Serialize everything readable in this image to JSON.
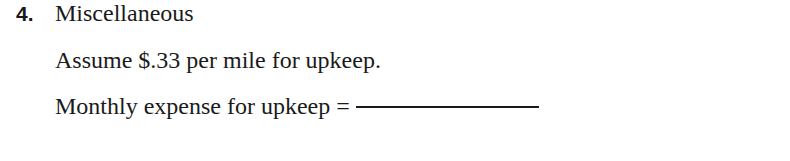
{
  "item": {
    "number": "4.",
    "heading": "Miscellaneous",
    "assumption": "Assume $.33 per mile for upkeep.",
    "prompt": "Monthly expense for upkeep ="
  }
}
